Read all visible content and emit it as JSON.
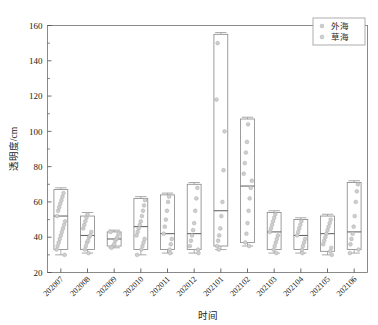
{
  "chart_data": {
    "type": "box",
    "title": "",
    "xlabel": "时间",
    "ylabel": "透明度/cm",
    "ylim": [
      20,
      160
    ],
    "ytick_values": [
      20,
      40,
      60,
      80,
      100,
      120,
      140,
      160
    ],
    "ytick_labels": [
      "20",
      "40",
      "60",
      "80",
      "100",
      "120",
      "140",
      "160"
    ],
    "yminor_step": 10,
    "grid": false,
    "legend_position": "upper-right",
    "legend": [
      {
        "label": "外海",
        "marker": "circle",
        "color": "#cfcfcf"
      },
      {
        "label": "草海",
        "marker": "circle",
        "color": "#c4c4c4"
      }
    ],
    "categories": [
      "202007",
      "202008",
      "202009",
      "202010",
      "202011",
      "202012",
      "202101",
      "202102",
      "202103",
      "202104",
      "202105",
      "202106"
    ],
    "boxes": [
      {
        "category": "202007",
        "whisker_low": 30,
        "q1": 33,
        "median": 52,
        "q3": 67,
        "whisker_high": 68,
        "points": [
          33,
          35,
          37,
          39,
          41,
          43,
          45,
          47,
          49,
          52,
          55,
          57,
          59,
          61,
          63,
          65,
          30
        ]
      },
      {
        "category": "202008",
        "whisker_low": 31,
        "q1": 33,
        "median": 41,
        "q3": 52,
        "whisker_high": 54,
        "points": [
          33,
          35,
          37,
          38,
          40,
          41,
          43,
          45,
          47,
          49,
          51,
          53,
          31
        ]
      },
      {
        "category": "202009",
        "whisker_low": 34,
        "q1": 35,
        "median": 39,
        "q3": 43,
        "whisker_high": 44,
        "points": [
          35,
          36,
          38,
          39,
          40,
          42,
          43,
          34
        ]
      },
      {
        "category": "202010",
        "whisker_low": 30,
        "q1": 33,
        "median": 46,
        "q3": 62,
        "whisker_high": 63,
        "points": [
          33,
          35,
          37,
          39,
          41,
          43,
          45,
          47,
          49,
          52,
          55,
          58,
          61,
          30
        ]
      },
      {
        "category": "202011",
        "whisker_low": 31,
        "q1": 33,
        "median": 42,
        "q3": 64,
        "whisker_high": 65,
        "points": [
          33,
          36,
          39,
          42,
          46,
          50,
          55,
          60,
          63,
          31
        ]
      },
      {
        "category": "202012",
        "whisker_low": 31,
        "q1": 33,
        "median": 42,
        "q3": 70,
        "whisker_high": 71,
        "points": [
          33,
          35,
          38,
          41,
          44,
          48,
          55,
          62,
          68,
          31
        ]
      },
      {
        "category": "202101",
        "whisker_low": 33,
        "q1": 35,
        "median": 55,
        "q3": 155,
        "whisker_high": 156,
        "points": [
          35,
          38,
          41,
          45,
          52,
          60,
          78,
          100,
          118,
          150,
          33
        ]
      },
      {
        "category": "202102",
        "whisker_low": 35,
        "q1": 37,
        "median": 69,
        "q3": 107,
        "whisker_high": 108,
        "points": [
          37,
          42,
          48,
          55,
          62,
          68,
          72,
          76,
          82,
          88,
          94,
          104,
          35
        ]
      },
      {
        "category": "202103",
        "whisker_low": 31,
        "q1": 33,
        "median": 43,
        "q3": 54,
        "whisker_high": 55,
        "points": [
          33,
          35,
          37,
          39,
          41,
          43,
          45,
          47,
          49,
          51,
          53,
          31
        ]
      },
      {
        "category": "202104",
        "whisker_low": 31,
        "q1": 33,
        "median": 41,
        "q3": 50,
        "whisker_high": 51,
        "points": [
          33,
          35,
          37,
          39,
          41,
          43,
          45,
          47,
          49,
          31
        ]
      },
      {
        "category": "202105",
        "whisker_low": 30,
        "q1": 32,
        "median": 42,
        "q3": 52,
        "whisker_high": 53,
        "points": [
          32,
          34,
          36,
          38,
          40,
          42,
          44,
          46,
          48,
          50,
          30
        ]
      },
      {
        "category": "202106",
        "whisker_low": 31,
        "q1": 33,
        "median": 43,
        "q3": 71,
        "whisker_high": 72,
        "points": [
          33,
          36,
          39,
          42,
          46,
          52,
          60,
          66,
          70,
          31
        ]
      }
    ]
  }
}
